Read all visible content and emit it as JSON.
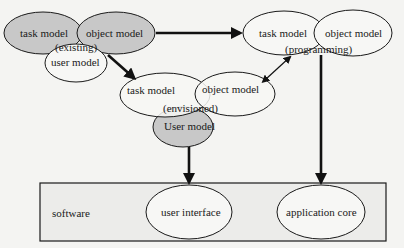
{
  "diagram": {
    "existing": {
      "task_model": "task model",
      "object_model": "object model",
      "user_model": "user model",
      "label": "(existing)"
    },
    "programming": {
      "task_model": "task model",
      "object_model": "object model",
      "label": "(programming)"
    },
    "envisioned": {
      "task_model": "task model",
      "object_model": "object model",
      "user_model": "User model",
      "label": "(envisioned)"
    },
    "software": {
      "label": "software",
      "user_interface": "user interface",
      "application_core": "application core"
    },
    "colors": {
      "shaded_fill": "#c8c8c8",
      "plain_fill": "#f7f7f5",
      "stroke": "#1a1a1a",
      "box_fill": "#ececea"
    }
  }
}
